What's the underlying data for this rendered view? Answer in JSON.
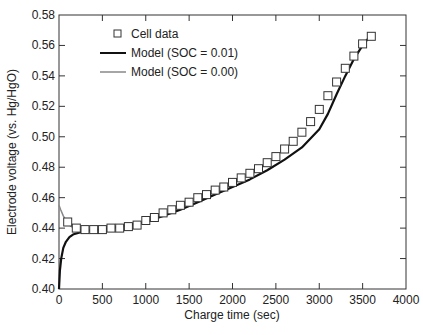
{
  "chart_data": {
    "type": "line",
    "title": "",
    "xlabel": "Charge time (sec)",
    "ylabel": "Electrode voltage (vs. Hg/HgO)",
    "xlim": [
      0,
      4000
    ],
    "ylim": [
      0.4,
      0.58
    ],
    "x_ticks": [
      0,
      500,
      1000,
      1500,
      2000,
      2500,
      3000,
      3500,
      4000
    ],
    "y_ticks": [
      0.4,
      0.42,
      0.44,
      0.46,
      0.48,
      0.5,
      0.52,
      0.54,
      0.56,
      0.58
    ],
    "y_tick_labels": [
      "0.40",
      "0.42",
      "0.44",
      "0.46",
      "0.48",
      "0.50",
      "0.52",
      "0.54",
      "0.56",
      "0.58"
    ],
    "grid": false,
    "legend_position": "top-left",
    "series": [
      {
        "name": "Cell data",
        "kind": "scatter",
        "marker": "open-square",
        "color": "#333333",
        "x": [
          100,
          200,
          300,
          400,
          500,
          600,
          700,
          800,
          900,
          1000,
          1100,
          1200,
          1300,
          1400,
          1500,
          1600,
          1700,
          1800,
          1900,
          2000,
          2100,
          2200,
          2300,
          2400,
          2500,
          2600,
          2700,
          2800,
          2900,
          3000,
          3100,
          3200,
          3300,
          3400,
          3500,
          3600
        ],
        "y": [
          0.444,
          0.44,
          0.439,
          0.439,
          0.439,
          0.44,
          0.44,
          0.441,
          0.442,
          0.445,
          0.447,
          0.45,
          0.452,
          0.455,
          0.457,
          0.46,
          0.462,
          0.465,
          0.467,
          0.47,
          0.473,
          0.476,
          0.479,
          0.483,
          0.487,
          0.492,
          0.497,
          0.503,
          0.51,
          0.518,
          0.527,
          0.536,
          0.545,
          0.553,
          0.561,
          0.566
        ]
      },
      {
        "name": "Model (SOC = 0.01)",
        "kind": "line",
        "color": "#111111",
        "x": [
          0,
          10,
          25,
          50,
          80,
          120,
          170,
          230,
          300,
          400,
          500,
          600,
          700,
          800,
          900,
          1000,
          1200,
          1400,
          1600,
          1800,
          2000,
          2200,
          2400,
          2600,
          2800,
          3000,
          3100,
          3200,
          3300,
          3400,
          3500,
          3600
        ],
        "y": [
          0.4,
          0.412,
          0.42,
          0.427,
          0.431,
          0.434,
          0.436,
          0.437,
          0.438,
          0.439,
          0.439,
          0.44,
          0.441,
          0.442,
          0.443,
          0.444,
          0.448,
          0.452,
          0.457,
          0.462,
          0.467,
          0.472,
          0.478,
          0.485,
          0.493,
          0.505,
          0.515,
          0.528,
          0.54,
          0.551,
          0.56,
          0.567
        ]
      },
      {
        "name": "Model (SOC = 0.00)",
        "kind": "line",
        "color": "#888888",
        "x": [
          0,
          20,
          50,
          80,
          120,
          170,
          230,
          300
        ],
        "y": [
          0.455,
          0.452,
          0.448,
          0.445,
          0.442,
          0.44,
          0.439,
          0.438
        ]
      }
    ]
  }
}
